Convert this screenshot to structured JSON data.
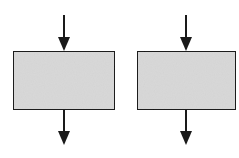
{
  "diagram": {
    "type": "flowchart-fragment",
    "background": "#ffffff",
    "stroke_color": "#1a1a1a",
    "box_fill": "#d9d9d9",
    "blocks": [
      {
        "id": "block-left",
        "label": "",
        "x": 13,
        "y": 51,
        "w": 102,
        "h": 59,
        "arrow_x": 64
      },
      {
        "id": "block-right",
        "label": "",
        "x": 137,
        "y": 51,
        "w": 99,
        "h": 59,
        "arrow_x": 186
      }
    ],
    "arrows": [
      {
        "id": "left-in",
        "from_y": 15,
        "to_y": 51
      },
      {
        "id": "left-out",
        "from_y": 110,
        "to_y": 145
      },
      {
        "id": "right-in",
        "from_y": 15,
        "to_y": 51
      },
      {
        "id": "right-out",
        "from_y": 110,
        "to_y": 145
      }
    ]
  }
}
